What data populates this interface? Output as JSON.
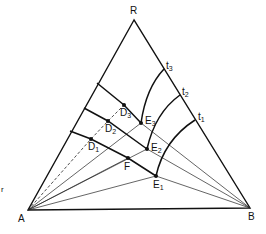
{
  "diagram": {
    "type": "ternary-phase-diagram",
    "vertices": {
      "R": {
        "label": "R",
        "x": 134,
        "y": 20
      },
      "A": {
        "label": "A",
        "x": 28,
        "y": 210
      },
      "B": {
        "label": "B",
        "x": 250,
        "y": 208
      }
    },
    "side_points": [
      {
        "label": "t",
        "sub": "3",
        "x": 164,
        "y": 69
      },
      {
        "label": "t",
        "sub": "2",
        "x": 180,
        "y": 95
      },
      {
        "label": "t",
        "sub": "1",
        "x": 195,
        "y": 120
      }
    ],
    "points_D": [
      {
        "label": "D",
        "sub": "3",
        "x": 124,
        "y": 105
      },
      {
        "label": "D",
        "sub": "2",
        "x": 108,
        "y": 121
      },
      {
        "label": "D",
        "sub": "1",
        "x": 91,
        "y": 139
      }
    ],
    "points_E": [
      {
        "label": "E",
        "sub": "3",
        "x": 141,
        "y": 123
      },
      {
        "label": "E",
        "sub": "2",
        "x": 147,
        "y": 149
      },
      {
        "label": "E",
        "sub": "1",
        "x": 156,
        "y": 176
      }
    ],
    "point_F": {
      "label": "F",
      "x": 128,
      "y": 158
    },
    "left_side_starts": [
      {
        "x": 97,
        "y": 83
      },
      {
        "x": 84,
        "y": 108
      },
      {
        "x": 70,
        "y": 131
      }
    ],
    "margin_mark": "r"
  }
}
